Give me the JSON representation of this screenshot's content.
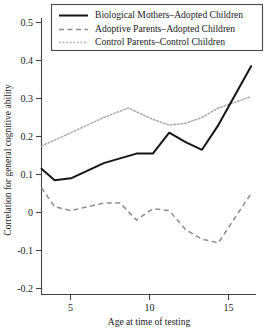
{
  "chart_data": {
    "type": "line",
    "title": "",
    "xlabel": "Age at time of testing",
    "ylabel": "Correlation for general cognitive ability",
    "xlim": [
      3.2,
      16.3
    ],
    "ylim": [
      -0.2,
      0.5
    ],
    "xticks": [
      5,
      10,
      15
    ],
    "xtick_labels": [
      "5",
      "10",
      "15"
    ],
    "yticks": [
      -0.2,
      -0.1,
      0,
      0.1,
      0.2,
      0.3,
      0.4,
      0.5
    ],
    "ytick_labels": [
      "-0.2",
      "-0.1",
      "0",
      "0.1",
      "0.2",
      "0.3",
      "0.4",
      "0.5"
    ],
    "grid": false,
    "legend_position": "top-right",
    "series": [
      {
        "name": "Biological Mothers–Adopted Children",
        "style": "solid",
        "color": "#151515",
        "x": [
          3.2,
          4.0,
          5.0,
          7.0,
          9.0,
          10.0,
          11.0,
          12.0,
          13.0,
          14.0,
          16.0
        ],
        "y": [
          0.115,
          0.085,
          0.09,
          0.13,
          0.155,
          0.155,
          0.21,
          0.185,
          0.165,
          0.23,
          0.385
        ]
      },
      {
        "name": "Adoptive Parents–Adopted Children",
        "style": "dashed",
        "color": "#8d8d8d",
        "x": [
          3.2,
          4.0,
          5.0,
          7.0,
          8.0,
          9.0,
          10.0,
          11.0,
          12.0,
          13.0,
          14.0,
          16.0
        ],
        "y": [
          0.065,
          0.015,
          0.005,
          0.025,
          0.025,
          -0.02,
          0.01,
          0.005,
          -0.045,
          -0.07,
          -0.08,
          0.05
        ]
      },
      {
        "name": "Control Parents–Control Children",
        "style": "dotted",
        "color": "#a8a8a8",
        "x": [
          3.2,
          5.0,
          7.0,
          8.5,
          10.0,
          11.0,
          12.0,
          13.0,
          14.0,
          16.0
        ],
        "y": [
          0.175,
          0.21,
          0.25,
          0.275,
          0.245,
          0.23,
          0.235,
          0.25,
          0.275,
          0.305
        ]
      }
    ]
  },
  "legend": {
    "items": [
      {
        "label": "Biological Mothers–Adopted Children",
        "style": "solid"
      },
      {
        "label": "Adoptive Parents–Adopted Children",
        "style": "dashed"
      },
      {
        "label": "Control Parents–Control Children",
        "style": "dotted"
      }
    ]
  },
  "axes": {
    "x_title": "Age at time of testing",
    "y_title": "Correlation for general cognitive ability",
    "x_tick_labels": [
      "5",
      "10",
      "15"
    ],
    "y_tick_labels": [
      "0.5",
      "0.4",
      "0.3",
      "0.2",
      "0.1",
      "0",
      "-0.1",
      "-0.2"
    ]
  }
}
